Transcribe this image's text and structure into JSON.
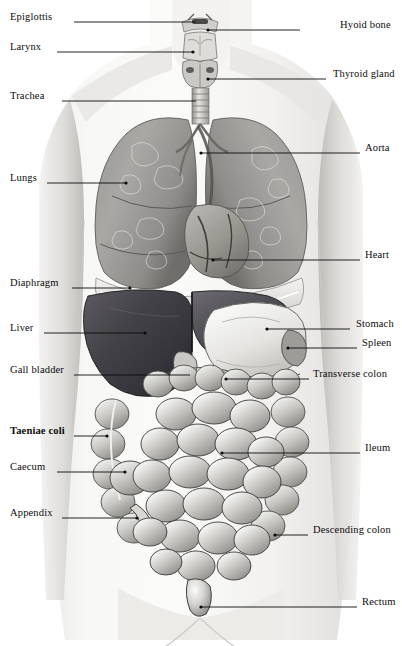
{
  "figure": {
    "style": "grayscale medical illustration, anterior view",
    "width": 402,
    "height": 646,
    "background": "#ffffff",
    "ink": "#0b0b0b"
  },
  "labels": {
    "left": [
      {
        "name": "epiglottis",
        "text": "Epiglottis",
        "x": 10,
        "y": 20,
        "lead_x1": 74,
        "lead_x2": 196,
        "lead_y": 22,
        "dot": false,
        "bold": false
      },
      {
        "name": "larynx",
        "text": "Larynx",
        "x": 10,
        "y": 50,
        "lead_x1": 57,
        "lead_x2": 193,
        "lead_y": 52,
        "dot": true,
        "bold": false
      },
      {
        "name": "trachea",
        "text": "Trachea",
        "x": 10,
        "y": 99,
        "lead_x1": 62,
        "lead_x2": 196,
        "lead_y": 101,
        "dot": false,
        "bold": false
      },
      {
        "name": "lungs",
        "text": "Lungs",
        "x": 10,
        "y": 181,
        "lead_x1": 47,
        "lead_x2": 126,
        "lead_y": 183,
        "dot": true,
        "bold": false
      },
      {
        "name": "diaphragm",
        "text": "Diaphragm",
        "x": 10,
        "y": 286,
        "lead_x1": 72,
        "lead_x2": 130,
        "lead_y": 288,
        "dot": true,
        "bold": false
      },
      {
        "name": "liver",
        "text": "Liver",
        "x": 10,
        "y": 331,
        "lead_x1": 44,
        "lead_x2": 145,
        "lead_y": 333,
        "dot": true,
        "bold": false
      },
      {
        "name": "gall-bladder",
        "text": "Gall bladder",
        "x": 10,
        "y": 373,
        "lead_x1": 74,
        "lead_x2": 190,
        "lead_y": 375,
        "dot": false,
        "bold": false
      },
      {
        "name": "taeniae-coli",
        "text": "Taeniae coli",
        "x": 10,
        "y": 434,
        "lead_x1": 74,
        "lead_x2": 107,
        "lead_y": 436,
        "dot": true,
        "bold": true
      },
      {
        "name": "caecum",
        "text": "Caecum",
        "x": 10,
        "y": 470,
        "lead_x1": 57,
        "lead_x2": 125,
        "lead_y": 472,
        "dot": true,
        "bold": false
      },
      {
        "name": "appendix",
        "text": "Appendix",
        "x": 10,
        "y": 516,
        "lead_x1": 62,
        "lead_x2": 137,
        "lead_y": 518,
        "dot": true,
        "bold": false
      }
    ],
    "right": [
      {
        "name": "hyoid-bone",
        "text": "Hyoid bone",
        "x": 340,
        "y": 28,
        "lead_x1": 300,
        "lead_x2": 208,
        "lead_y": 30,
        "dot": true,
        "bold": false
      },
      {
        "name": "thyroid-gland",
        "text": "Thyroid gland",
        "x": 333,
        "y": 77,
        "lead_x1": 326,
        "lead_x2": 208,
        "lead_y": 79,
        "dot": true,
        "bold": false
      },
      {
        "name": "aorta",
        "text": "Aorta",
        "x": 365,
        "y": 151,
        "lead_x1": 360,
        "lead_x2": 201,
        "lead_y": 153,
        "dot": true,
        "bold": false
      },
      {
        "name": "heart",
        "text": "Heart",
        "x": 365,
        "y": 258,
        "lead_x1": 360,
        "lead_x2": 213,
        "lead_y": 260,
        "dot": true,
        "bold": false
      },
      {
        "name": "stomach",
        "text": "Stomach",
        "x": 356,
        "y": 327,
        "lead_x1": 350,
        "lead_x2": 267,
        "lead_y": 329,
        "dot": true,
        "bold": false
      },
      {
        "name": "spleen",
        "text": "Spleen",
        "x": 362,
        "y": 346,
        "lead_x1": 357,
        "lead_x2": 288,
        "lead_y": 348,
        "dot": true,
        "bold": false
      },
      {
        "name": "transverse-colon",
        "text": "Transverse colon",
        "x": 313,
        "y": 377,
        "lead_x1": 309,
        "lead_x2": 226,
        "lead_y": 379,
        "dot": true,
        "bold": false
      },
      {
        "name": "ileum",
        "text": "Ileum",
        "x": 365,
        "y": 451,
        "lead_x1": 360,
        "lead_x2": 222,
        "lead_y": 453,
        "dot": true,
        "bold": false
      },
      {
        "name": "descending-colon",
        "text": "Descending colon",
        "x": 313,
        "y": 533,
        "lead_x1": 308,
        "lead_x2": 275,
        "lead_y": 535,
        "dot": true,
        "bold": false
      },
      {
        "name": "rectum",
        "text": "Rectum",
        "x": 362,
        "y": 605,
        "lead_x1": 357,
        "lead_x2": 201,
        "lead_y": 607,
        "dot": true,
        "bold": false
      }
    ]
  },
  "organs": [
    {
      "name": "larynx",
      "region": "neck, midline",
      "tone": "light gray"
    },
    {
      "name": "trachea",
      "region": "neck to upper thorax",
      "tone": "light gray ringed"
    },
    {
      "name": "right-lung",
      "region": "left of image, thorax",
      "tone": "mid gray"
    },
    {
      "name": "left-lung",
      "region": "right of image, thorax",
      "tone": "mid gray"
    },
    {
      "name": "heart",
      "region": "central thorax, inferior",
      "tone": "mid gray"
    },
    {
      "name": "diaphragm",
      "region": "below lungs",
      "tone": "light gray"
    },
    {
      "name": "liver",
      "region": "upper left abdomen",
      "tone": "dark gray"
    },
    {
      "name": "stomach",
      "region": "upper right abdomen",
      "tone": "pale gray"
    },
    {
      "name": "transverse-colon",
      "region": "mid abdomen, horizontal",
      "tone": "mid gray"
    },
    {
      "name": "small-intestine",
      "region": "central lower abdomen",
      "tone": "mid gray"
    },
    {
      "name": "ascending-colon",
      "region": "left flank",
      "tone": "mid gray"
    },
    {
      "name": "descending-colon",
      "region": "right flank",
      "tone": "mid gray"
    },
    {
      "name": "caecum",
      "region": "lower left abdomen",
      "tone": "mid gray"
    },
    {
      "name": "appendix",
      "region": "lower left, small process",
      "tone": "mid gray"
    },
    {
      "name": "rectum",
      "region": "pelvic midline, inferior",
      "tone": "mid gray"
    }
  ]
}
